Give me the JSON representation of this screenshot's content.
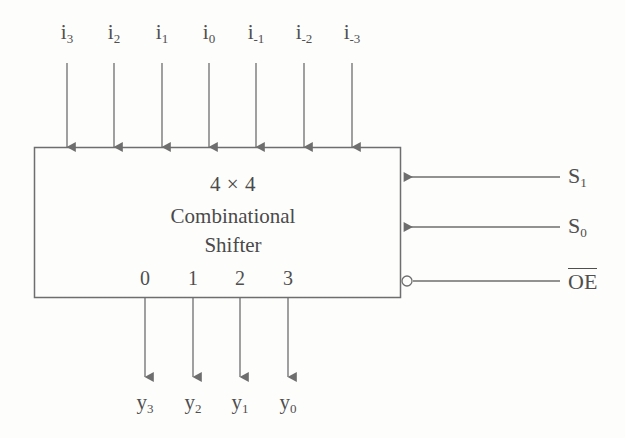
{
  "diagram": {
    "title_lines": {
      "line1": "4 × 4",
      "line2": "Combinational",
      "line3": "Shifter"
    },
    "inputs": [
      {
        "label": "i",
        "sub": "3",
        "x": 67
      },
      {
        "label": "i",
        "sub": "2",
        "x": 114
      },
      {
        "label": "i",
        "sub": "1",
        "x": 162
      },
      {
        "label": "i",
        "sub": "0",
        "x": 209
      },
      {
        "label": "i",
        "sub": "-1",
        "x": 256
      },
      {
        "label": "i",
        "sub": "-2",
        "x": 304
      },
      {
        "label": "i",
        "sub": "-3",
        "x": 352
      }
    ],
    "output_ports": [
      {
        "label": "0",
        "x": 145
      },
      {
        "label": "1",
        "x": 193
      },
      {
        "label": "2",
        "x": 240
      },
      {
        "label": "3",
        "x": 288
      }
    ],
    "outputs": [
      {
        "label": "y",
        "sub": "3",
        "x": 145
      },
      {
        "label": "y",
        "sub": "2",
        "x": 193
      },
      {
        "label": "y",
        "sub": "1",
        "x": 240
      },
      {
        "label": "y",
        "sub": "0",
        "x": 288
      }
    ],
    "controls": [
      {
        "label": "S",
        "sub": "1",
        "overbar": false,
        "y": 177
      },
      {
        "label": "S",
        "sub": "0",
        "overbar": false,
        "y": 227
      },
      {
        "label": "OE",
        "sub": "",
        "overbar": true,
        "y": 281
      }
    ],
    "colors": {
      "stroke": "#6e6e6e",
      "text": "#4f4f4f",
      "background": "#fdfdfc"
    }
  }
}
